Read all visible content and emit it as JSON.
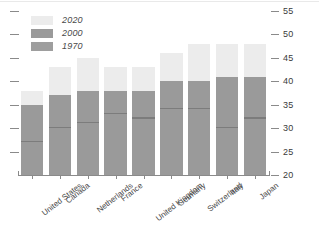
{
  "chart_data": {
    "type": "bar",
    "title": "",
    "subtitle": "",
    "xlabel": "",
    "ylabel": "",
    "ylim": [
      20,
      55
    ],
    "grid": false,
    "legend_position": "top-left",
    "categories": [
      "United States",
      "Canada",
      "Netherlands",
      "France",
      "United Kingdom",
      "Germany",
      "Switzerland",
      "Italy",
      "Japan"
    ],
    "yticks": [
      20,
      25,
      30,
      35,
      40,
      45,
      50,
      55
    ],
    "ytick_labels": [
      "20",
      "25",
      "30",
      "35",
      "40",
      "45",
      "50",
      "55"
    ],
    "series": [
      {
        "name": "2020",
        "color": "#ececec",
        "values": [
          38,
          43,
          45,
          43,
          43,
          46,
          48,
          48,
          48
        ]
      },
      {
        "name": "2000",
        "color": "#9a9a9a",
        "values": [
          35,
          37,
          38,
          38,
          38,
          40,
          40,
          41,
          41
        ]
      },
      {
        "name": "1970",
        "color": "#7c7c7c",
        "values": [
          27,
          30,
          31,
          33,
          32,
          34,
          34,
          30,
          32
        ]
      }
    ]
  },
  "legend": {
    "items": [
      {
        "label": "2020",
        "color": "#ececec"
      },
      {
        "label": "2000",
        "color": "#9a9a9a"
      },
      {
        "label": "1970",
        "color": "#9e9e9e"
      }
    ]
  },
  "axis": {
    "baseline_value": 20,
    "top_value": 55
  }
}
